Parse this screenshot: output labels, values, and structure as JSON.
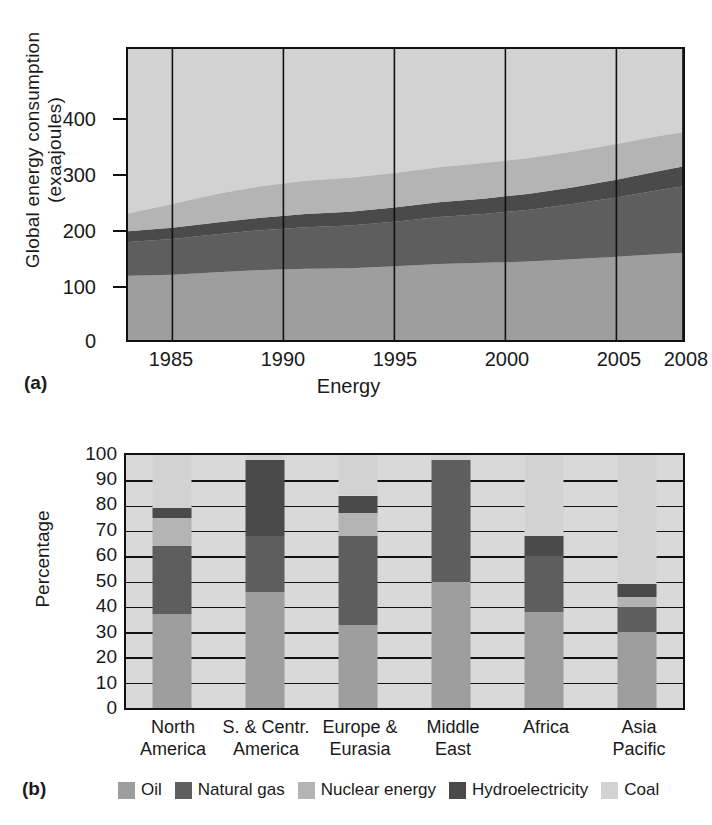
{
  "figure_a": {
    "tag": "(a)",
    "ylabel": "Global energy consumption (exaajoules)",
    "xlabel": "Energy",
    "yticks": [
      "400",
      "300",
      "200",
      "100",
      "0"
    ],
    "xticks": [
      "1985",
      "1990",
      "1995",
      "2000",
      "2005",
      "2008"
    ]
  },
  "figure_b": {
    "tag": "(b)",
    "ylabel": "Percentage",
    "yticks": [
      "100",
      "90",
      "80",
      "70",
      "60",
      "50",
      "40",
      "30",
      "20",
      "10",
      "0"
    ],
    "categories": [
      "North America",
      "S. & Centr. America",
      "Europe & Eurasia",
      "Middle East",
      "Africa",
      "Asia Pacific"
    ],
    "categories_line1": [
      "North",
      "S. & Centr.",
      "Europe &",
      "Middle",
      "Africa",
      "Asia"
    ],
    "categories_line2": [
      "America",
      "America",
      "Eurasia",
      "East",
      "",
      "Pacific"
    ]
  },
  "legend": {
    "items": [
      {
        "label": "Oil",
        "color": "#9e9e9e"
      },
      {
        "label": "Natural gas",
        "color": "#5e5e5e"
      },
      {
        "label": "Nuclear energy",
        "color": "#b4b4b4"
      },
      {
        "label": "Hydroelectricity",
        "color": "#4a4a4a"
      },
      {
        "label": "Coal",
        "color": "#d2d2d2"
      }
    ]
  },
  "colors": {
    "oil": "#9e9e9e",
    "natural_gas": "#5e5e5e",
    "nuclear": "#b4b4b4",
    "hydro": "#4a4a4a",
    "coal": "#d2d2d2",
    "axis": "#111111",
    "plot_bg": "#d9d9d9"
  },
  "chart_data": [
    {
      "id": "a",
      "type": "area",
      "stacked": true,
      "title": "",
      "xlabel": "Energy",
      "ylabel": "Global energy consumption (exaajoules)",
      "xlim": [
        1983,
        2008
      ],
      "ylim": [
        0,
        490
      ],
      "yticks": [
        0,
        100,
        200,
        300,
        400
      ],
      "xticks": [
        1985,
        1990,
        1995,
        2000,
        2005,
        2008
      ],
      "grid": "vertical-only",
      "x": [
        1983,
        1985,
        1987,
        1989,
        1991,
        1993,
        1995,
        1997,
        1999,
        2001,
        2003,
        2005,
        2007,
        2008
      ],
      "series": [
        {
          "name": "Oil",
          "color": "#9e9e9e",
          "values": [
            108,
            110,
            114,
            118,
            120,
            121,
            124,
            128,
            130,
            132,
            136,
            140,
            145,
            147
          ]
        },
        {
          "name": "Natural gas",
          "color": "#5e5e5e",
          "values": [
            57,
            60,
            64,
            67,
            70,
            72,
            75,
            79,
            82,
            87,
            93,
            100,
            108,
            112
          ]
        },
        {
          "name": "Hydroelectricity",
          "color": "#4a4a4a",
          "values": [
            18,
            19,
            20,
            21,
            22,
            23,
            24,
            25,
            26,
            27,
            28,
            30,
            32,
            33
          ]
        },
        {
          "name": "Nuclear energy",
          "color": "#b4b4b4",
          "values": [
            30,
            40,
            48,
            53,
            56,
            57,
            58,
            59,
            60,
            60,
            60,
            60,
            59,
            58
          ]
        },
        {
          "name": "Coal",
          "color": "#d2d2d2",
          "values": [
            115,
            118,
            120,
            122,
            122,
            121,
            121,
            122,
            120,
            127,
            138,
            150,
            163,
            168
          ]
        }
      ]
    },
    {
      "id": "b",
      "type": "bar",
      "stacked": true,
      "ylabel": "Percentage",
      "ylim": [
        0,
        100
      ],
      "yticks": [
        0,
        10,
        20,
        30,
        40,
        50,
        60,
        70,
        80,
        90,
        100
      ],
      "grid": "horizontal",
      "categories": [
        "North America",
        "S. & Centr. America",
        "Europe & Eurasia",
        "Middle East",
        "Africa",
        "Asia Pacific"
      ],
      "series": [
        {
          "name": "Oil",
          "color": "#9e9e9e",
          "values": [
            37,
            46,
            33,
            50,
            38,
            30
          ]
        },
        {
          "name": "Natural gas",
          "color": "#5e5e5e",
          "values": [
            27,
            22,
            35,
            48,
            22,
            10
          ]
        },
        {
          "name": "Nuclear energy",
          "color": "#b4b4b4",
          "values": [
            11,
            0,
            9,
            0,
            0,
            4
          ]
        },
        {
          "name": "Hydroelectricity",
          "color": "#4a4a4a",
          "values": [
            4,
            30,
            7,
            0,
            8,
            5
          ]
        },
        {
          "name": "Coal",
          "color": "#d2d2d2",
          "values": [
            21,
            2,
            16,
            2,
            32,
            51
          ]
        }
      ]
    }
  ]
}
